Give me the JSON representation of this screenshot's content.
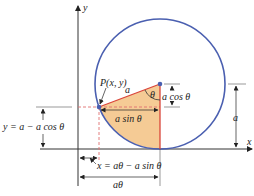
{
  "diagram": {
    "labels": {
      "y_axis": "y",
      "x_axis": "x",
      "point": "P(x, y)",
      "radius": "a",
      "theta": "θ",
      "a_cos": "a cos θ",
      "a_sin": "a sin θ",
      "y_eq": "y = a − a cos θ",
      "x_eq": "x = aθ − a sin θ",
      "a_theta": "aθ",
      "a_height": "a"
    },
    "colors": {
      "circle": "#4a5fb0",
      "radius_line": "#d9453a",
      "dashed": "#e07070",
      "fill": "#f4c58a",
      "axis": "#333333"
    }
  }
}
